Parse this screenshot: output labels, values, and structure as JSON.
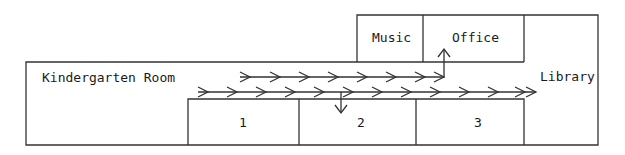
{
  "rooms": {
    "kindergarten": "Kindergarten Room",
    "music": "Music",
    "office": "Office",
    "library": "Library",
    "room1": "1",
    "room2": "2",
    "room3": "3"
  },
  "colors": {
    "line": "#333333",
    "background": "#ffffff"
  }
}
